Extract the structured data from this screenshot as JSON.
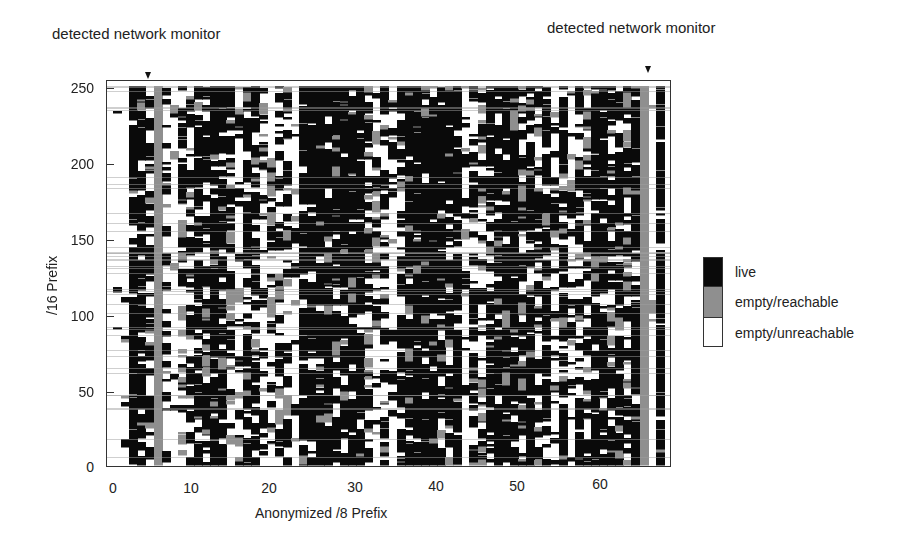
{
  "annotations": [
    {
      "text": "detected network monitor",
      "x": 52,
      "y": 33,
      "marker_x": 148
    },
    {
      "text": "detected network monitor",
      "x": 547,
      "y": 27,
      "marker_x": 648
    }
  ],
  "colors": {
    "live": "#0a0a0a",
    "empty_reachable": "#8f8f8f",
    "empty_unreachable": "#ffffff",
    "frame": "#333333",
    "text": "#222222"
  },
  "legend": {
    "items": [
      {
        "label": "live",
        "color": "#0a0a0a"
      },
      {
        "label": "empty/reachable",
        "color": "#8f8f8f"
      },
      {
        "label": "empty/unreachable",
        "color": "#ffffff"
      }
    ]
  },
  "axes": {
    "xlabel": "Anonymized /8 Prefix",
    "ylabel": "/16 Prefix",
    "xticks": [
      "0",
      "10",
      "20",
      "30",
      "40",
      "50",
      "60"
    ],
    "yticks": [
      "0",
      "50",
      "100",
      "150",
      "200",
      "250"
    ]
  },
  "chart_data": {
    "type": "heatmap",
    "title": "",
    "xlabel": "Anonymized /8 Prefix",
    "ylabel": "/16 Prefix",
    "xlim": [
      0,
      69
    ],
    "ylim": [
      0,
      256
    ],
    "x_ticks": [
      0,
      10,
      20,
      30,
      40,
      50,
      60
    ],
    "y_ticks": [
      0,
      50,
      100,
      150,
      200,
      250
    ],
    "grid": false,
    "legend_position": "right",
    "categories": [
      "live",
      "empty/reachable",
      "empty/unreachable"
    ],
    "annotations": [
      {
        "text": "detected network monitor",
        "x_prefix": 5
      },
      {
        "text": "detected network monitor",
        "x_prefix": 66
      }
    ],
    "columns_note": "Per-/8 column approximate fraction of /16 prefixes in each state (live, empty/reachable, empty/unreachable), estimated visually.",
    "column_profiles": [
      {
        "x": 0,
        "live": 0.03,
        "reach": 0.0,
        "unreach": 0.97
      },
      {
        "x": 1,
        "live": 0.05,
        "reach": 0.02,
        "unreach": 0.93
      },
      {
        "x": 2,
        "live": 0.8,
        "reach": 0.03,
        "unreach": 0.17
      },
      {
        "x": 3,
        "live": 0.78,
        "reach": 0.04,
        "unreach": 0.18
      },
      {
        "x": 4,
        "live": 0.6,
        "reach": 0.05,
        "unreach": 0.35
      },
      {
        "x": 5,
        "live": 0.0,
        "reach": 1.0,
        "unreach": 0.0
      },
      {
        "x": 6,
        "live": 0.3,
        "reach": 0.05,
        "unreach": 0.65
      },
      {
        "x": 7,
        "live": 0.1,
        "reach": 0.03,
        "unreach": 0.87
      },
      {
        "x": 8,
        "live": 0.35,
        "reach": 0.15,
        "unreach": 0.5
      },
      {
        "x": 9,
        "live": 0.4,
        "reach": 0.1,
        "unreach": 0.5
      },
      {
        "x": 10,
        "live": 0.7,
        "reach": 0.05,
        "unreach": 0.25
      },
      {
        "x": 11,
        "live": 0.55,
        "reach": 0.1,
        "unreach": 0.35
      },
      {
        "x": 12,
        "live": 0.85,
        "reach": 0.03,
        "unreach": 0.12
      },
      {
        "x": 13,
        "live": 0.75,
        "reach": 0.05,
        "unreach": 0.2
      },
      {
        "x": 14,
        "live": 0.4,
        "reach": 0.15,
        "unreach": 0.45
      },
      {
        "x": 15,
        "live": 0.15,
        "reach": 0.05,
        "unreach": 0.8
      },
      {
        "x": 16,
        "live": 0.55,
        "reach": 0.1,
        "unreach": 0.35
      },
      {
        "x": 17,
        "live": 0.7,
        "reach": 0.1,
        "unreach": 0.2
      },
      {
        "x": 18,
        "live": 0.3,
        "reach": 0.1,
        "unreach": 0.6
      },
      {
        "x": 19,
        "live": 0.2,
        "reach": 0.1,
        "unreach": 0.7
      },
      {
        "x": 20,
        "live": 0.45,
        "reach": 0.1,
        "unreach": 0.45
      },
      {
        "x": 21,
        "live": 0.3,
        "reach": 0.15,
        "unreach": 0.55
      },
      {
        "x": 22,
        "live": 0.1,
        "reach": 0.05,
        "unreach": 0.85
      },
      {
        "x": 23,
        "live": 0.85,
        "reach": 0.03,
        "unreach": 0.12
      },
      {
        "x": 24,
        "live": 0.9,
        "reach": 0.02,
        "unreach": 0.08
      },
      {
        "x": 25,
        "live": 0.85,
        "reach": 0.05,
        "unreach": 0.1
      },
      {
        "x": 26,
        "live": 0.85,
        "reach": 0.05,
        "unreach": 0.1
      },
      {
        "x": 27,
        "live": 0.8,
        "reach": 0.05,
        "unreach": 0.15
      },
      {
        "x": 28,
        "live": 0.85,
        "reach": 0.05,
        "unreach": 0.1
      },
      {
        "x": 29,
        "live": 0.8,
        "reach": 0.05,
        "unreach": 0.15
      },
      {
        "x": 30,
        "live": 0.85,
        "reach": 0.03,
        "unreach": 0.12
      },
      {
        "x": 31,
        "live": 0.45,
        "reach": 0.15,
        "unreach": 0.4
      },
      {
        "x": 32,
        "live": 0.2,
        "reach": 0.1,
        "unreach": 0.7
      },
      {
        "x": 33,
        "live": 0.4,
        "reach": 0.1,
        "unreach": 0.5
      },
      {
        "x": 34,
        "live": 0.15,
        "reach": 0.05,
        "unreach": 0.8
      },
      {
        "x": 35,
        "live": 0.5,
        "reach": 0.1,
        "unreach": 0.4
      },
      {
        "x": 36,
        "live": 0.85,
        "reach": 0.03,
        "unreach": 0.12
      },
      {
        "x": 37,
        "live": 0.9,
        "reach": 0.02,
        "unreach": 0.08
      },
      {
        "x": 38,
        "live": 0.85,
        "reach": 0.05,
        "unreach": 0.1
      },
      {
        "x": 39,
        "live": 0.85,
        "reach": 0.05,
        "unreach": 0.1
      },
      {
        "x": 40,
        "live": 0.8,
        "reach": 0.05,
        "unreach": 0.15
      },
      {
        "x": 41,
        "live": 0.55,
        "reach": 0.15,
        "unreach": 0.3
      },
      {
        "x": 42,
        "live": 0.75,
        "reach": 0.05,
        "unreach": 0.2
      },
      {
        "x": 43,
        "live": 0.1,
        "reach": 0.05,
        "unreach": 0.85
      },
      {
        "x": 44,
        "live": 0.5,
        "reach": 0.1,
        "unreach": 0.4
      },
      {
        "x": 45,
        "live": 0.3,
        "reach": 0.15,
        "unreach": 0.55
      },
      {
        "x": 46,
        "live": 0.7,
        "reach": 0.05,
        "unreach": 0.25
      },
      {
        "x": 47,
        "live": 0.85,
        "reach": 0.05,
        "unreach": 0.1
      },
      {
        "x": 48,
        "live": 0.85,
        "reach": 0.05,
        "unreach": 0.1
      },
      {
        "x": 49,
        "live": 0.8,
        "reach": 0.05,
        "unreach": 0.15
      },
      {
        "x": 50,
        "live": 0.55,
        "reach": 0.15,
        "unreach": 0.3
      },
      {
        "x": 51,
        "live": 0.8,
        "reach": 0.05,
        "unreach": 0.15
      },
      {
        "x": 52,
        "live": 0.4,
        "reach": 0.1,
        "unreach": 0.5
      },
      {
        "x": 53,
        "live": 0.75,
        "reach": 0.05,
        "unreach": 0.2
      },
      {
        "x": 54,
        "live": 0.25,
        "reach": 0.05,
        "unreach": 0.7
      },
      {
        "x": 55,
        "live": 0.7,
        "reach": 0.05,
        "unreach": 0.25
      },
      {
        "x": 56,
        "live": 0.3,
        "reach": 0.05,
        "unreach": 0.65
      },
      {
        "x": 57,
        "live": 0.55,
        "reach": 0.1,
        "unreach": 0.35
      },
      {
        "x": 58,
        "live": 0.4,
        "reach": 0.15,
        "unreach": 0.45
      },
      {
        "x": 59,
        "live": 0.8,
        "reach": 0.05,
        "unreach": 0.15
      },
      {
        "x": 60,
        "live": 0.75,
        "reach": 0.05,
        "unreach": 0.2
      },
      {
        "x": 61,
        "live": 0.5,
        "reach": 0.15,
        "unreach": 0.35
      },
      {
        "x": 62,
        "live": 0.7,
        "reach": 0.1,
        "unreach": 0.2
      },
      {
        "x": 63,
        "live": 0.45,
        "reach": 0.15,
        "unreach": 0.4
      },
      {
        "x": 64,
        "live": 0.65,
        "reach": 0.1,
        "unreach": 0.25
      },
      {
        "x": 65,
        "live": 0.0,
        "reach": 1.0,
        "unreach": 0.0
      },
      {
        "x": 66,
        "live": 0.0,
        "reach": 0.02,
        "unreach": 0.98
      },
      {
        "x": 67,
        "live": 0.85,
        "reach": 0.03,
        "unreach": 0.12
      }
    ]
  }
}
